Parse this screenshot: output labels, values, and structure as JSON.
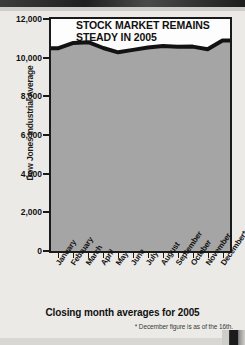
{
  "chart_data": {
    "type": "line",
    "title": "STOCK MARKET REMAINS STEADY IN 2005",
    "title_line1": "STOCK MARKET REMAINS",
    "title_line2": "STEADY IN 2005",
    "caption": "Closing month averages for 2005",
    "footnote": "* December figure is as of the 16th.",
    "xlabel": "",
    "ylabel": "Dow Jones Industrial Average",
    "categories": [
      "January",
      "February",
      "March",
      "April",
      "May",
      "June",
      "July",
      "August",
      "September",
      "October",
      "November",
      "December*"
    ],
    "x_tick_labels": [
      "January",
      "February",
      "March",
      "April",
      "May",
      "June",
      "July",
      "August",
      "September",
      "October",
      "November",
      "December*"
    ],
    "y_tick_labels": [
      "0",
      "2,000",
      "4,000",
      "6,000",
      "8,000",
      "10,000",
      "12,000"
    ],
    "y_tick_values": [
      0,
      2000,
      4000,
      6000,
      8000,
      10000,
      12000
    ],
    "ylim": [
      0,
      12000
    ],
    "values": [
      10490,
      10766,
      10800,
      10500,
      10280,
      10400,
      10520,
      10600,
      10560,
      10570,
      10440,
      10890
    ],
    "series": [
      {
        "name": "Dow Jones Industrial Average",
        "values": [
          10490,
          10766,
          10800,
          10500,
          10280,
          10400,
          10520,
          10600,
          10560,
          10570,
          10440,
          10890
        ]
      }
    ],
    "grid": true,
    "grid_vertical": true,
    "grid_horizontal": true,
    "legend": false,
    "line_color": "#121212",
    "fill_color": "#a5a5a5",
    "plot_background": "#a5a5a5",
    "axis_color": "#1a1a1a"
  }
}
